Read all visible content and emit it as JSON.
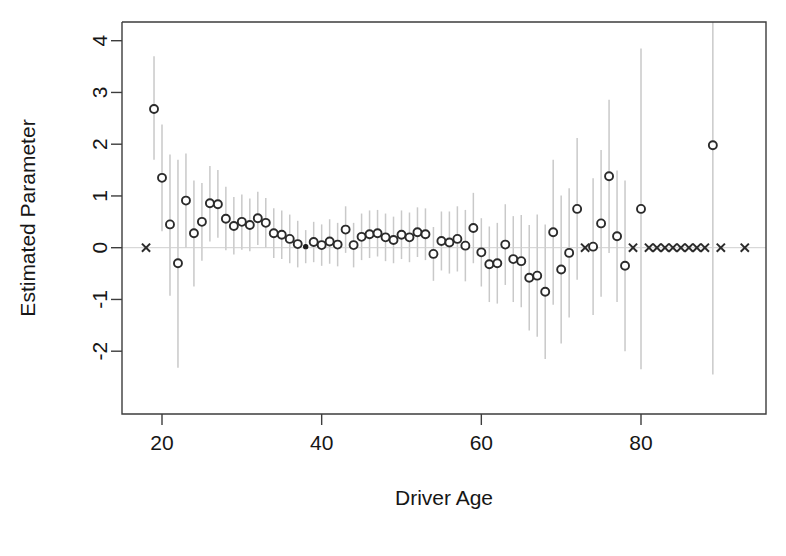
{
  "chart_data": {
    "type": "scatter",
    "title": "",
    "xlabel": "Driver Age",
    "ylabel": "Estimated Parameter",
    "xlim": [
      17.2,
      93.5
    ],
    "ylim": [
      -2.55,
      4.35
    ],
    "xticks": [
      20,
      40,
      60,
      80
    ],
    "xticklabels": [
      "20",
      "40",
      "60",
      "80"
    ],
    "yticks": [
      -2,
      -1,
      0,
      1,
      2,
      3,
      4
    ],
    "yticklabels": [
      "-2",
      "-1",
      "0",
      "1",
      "2",
      "3",
      "4"
    ],
    "grid": false,
    "legend": null,
    "zero_reference_line": 0,
    "marker_styles": {
      "estimate": "open-circle",
      "estimate_precise": "filled-circle",
      "reference_or_missing": "cross"
    },
    "errorbar_color": "#c9c9c9",
    "point_color": "#2b2b2b",
    "series": [
      {
        "name": "Estimated Parameter with 95% interval",
        "x": [
          19,
          20,
          21,
          22,
          23,
          24,
          25,
          26,
          27,
          28,
          29,
          30,
          31,
          32,
          33,
          34,
          35,
          36,
          37,
          38,
          39,
          40,
          41,
          42,
          43,
          44,
          45,
          46,
          47,
          48,
          49,
          50,
          51,
          52,
          53,
          54,
          55,
          56,
          57,
          58,
          59,
          60,
          61,
          62,
          63,
          64,
          65,
          66,
          67,
          68,
          69,
          70,
          71,
          72,
          74,
          75,
          76,
          77,
          78,
          80,
          89
        ],
        "y": [
          2.68,
          1.35,
          0.45,
          -0.3,
          0.91,
          0.28,
          0.5,
          0.86,
          0.84,
          0.56,
          0.42,
          0.5,
          0.44,
          0.57,
          0.48,
          0.28,
          0.25,
          0.17,
          0.07,
          0.02,
          0.11,
          0.05,
          0.12,
          0.06,
          0.35,
          0.05,
          0.21,
          0.26,
          0.28,
          0.2,
          0.15,
          0.25,
          0.2,
          0.3,
          0.26,
          -0.12,
          0.13,
          0.1,
          0.17,
          0.04,
          0.38,
          -0.09,
          -0.32,
          -0.3,
          0.06,
          -0.22,
          -0.26,
          -0.58,
          -0.54,
          -0.85,
          0.3,
          -0.42,
          -0.1,
          0.75,
          0.02,
          0.47,
          1.38,
          0.22,
          -0.35,
          0.75,
          1.98
        ],
        "ylow": [
          1.7,
          0.32,
          -0.93,
          -2.32,
          0.0,
          -0.75,
          -0.25,
          0.12,
          0.19,
          -0.05,
          -0.13,
          -0.04,
          -0.07,
          0.05,
          0.0,
          -0.2,
          -0.22,
          -0.3,
          -0.38,
          -0.3,
          -0.28,
          -0.35,
          -0.31,
          -0.36,
          -0.1,
          -0.38,
          -0.24,
          -0.2,
          -0.17,
          -0.26,
          -0.3,
          -0.22,
          -0.28,
          -0.18,
          -0.24,
          -0.64,
          -0.44,
          -0.5,
          -0.46,
          -0.65,
          -0.3,
          -0.75,
          -1.05,
          -1.08,
          -0.72,
          -1.05,
          -1.15,
          -1.6,
          -1.72,
          -2.15,
          -1.1,
          -1.85,
          -1.35,
          -0.62,
          -1.3,
          -0.95,
          -0.1,
          -1.05,
          -2.0,
          -2.35,
          -2.45
        ],
        "yhigh": [
          3.7,
          2.38,
          1.8,
          1.7,
          1.82,
          1.3,
          1.25,
          1.58,
          1.5,
          1.18,
          0.98,
          1.03,
          0.95,
          1.08,
          0.96,
          0.76,
          0.72,
          0.64,
          0.52,
          0.34,
          0.5,
          0.45,
          0.55,
          0.48,
          0.8,
          0.48,
          0.66,
          0.72,
          0.73,
          0.66,
          0.6,
          0.72,
          0.68,
          0.78,
          0.76,
          0.4,
          0.7,
          0.7,
          0.8,
          0.73,
          1.06,
          0.57,
          0.41,
          0.48,
          0.84,
          0.61,
          0.63,
          0.44,
          0.64,
          0.45,
          1.7,
          1.01,
          1.15,
          2.12,
          1.34,
          1.89,
          2.86,
          1.49,
          1.3,
          3.85,
          6.41
        ]
      }
    ],
    "cross_markers": {
      "note": "reference / no-estimate ages plotted at y = 0",
      "x": [
        18,
        73,
        79,
        81,
        82,
        83,
        84,
        85,
        86,
        87,
        88,
        90,
        93
      ],
      "y": [
        0,
        0,
        0,
        0,
        0,
        0,
        0,
        0,
        0,
        0,
        0,
        0,
        0
      ]
    },
    "filled_marker": {
      "x": [
        38
      ],
      "y": [
        0.02
      ]
    }
  },
  "axes": {
    "x_title": "Driver Age",
    "y_title": "Estimated Parameter"
  }
}
